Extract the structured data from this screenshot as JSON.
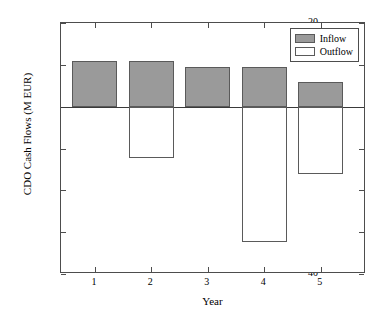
{
  "chart_data": {
    "type": "bar",
    "title": "",
    "subtitle": "",
    "xlabel": "Year",
    "ylabel": "CDO Cash Flows (M EUR)",
    "categories": [
      "1",
      "2",
      "3",
      "4",
      "5"
    ],
    "series": [
      {
        "name": "Inflow",
        "color": "#9a9a9a",
        "values": [
          11.0,
          11.0,
          9.6,
          9.5,
          6.0
        ]
      },
      {
        "name": "Outflow",
        "color": "#ffffff",
        "values": [
          0,
          -12.2,
          0,
          -32.3,
          -16.2
        ]
      }
    ],
    "ylim": [
      -40,
      20
    ],
    "xlim": [
      0.4,
      5.8
    ],
    "yticks": [
      20,
      10,
      0,
      -10,
      -20,
      -30,
      -40
    ],
    "ytick_labels": [
      "20",
      "10",
      "0",
      "−10",
      "−20",
      "−30",
      "−40"
    ],
    "xticks": [
      1,
      2,
      3,
      4,
      5
    ],
    "xtick_labels": [
      "1",
      "2",
      "3",
      "4",
      "5"
    ],
    "grid": false,
    "legend_position": "top-right",
    "legend": [
      {
        "label": "Inflow",
        "swatch_color": "#9a9a9a",
        "swatch_border": "#5a5a5a"
      },
      {
        "label": "Outflow",
        "swatch_color": "#ffffff",
        "swatch_border": "#5a5a5a"
      }
    ],
    "zero_line": true,
    "bar_width": 0.8,
    "axis_color": "#4d4d4d",
    "background_color": "#ffffff"
  }
}
